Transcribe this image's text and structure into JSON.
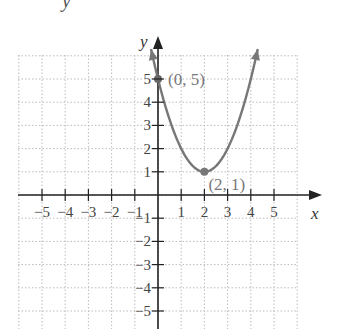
{
  "header": {
    "cropped_text": "y"
  },
  "chart_data": {
    "type": "line",
    "title": "",
    "xlabel": "x",
    "ylabel": "y",
    "xlim": [
      -6,
      6
    ],
    "ylim": [
      -6,
      6.5
    ],
    "grid": true,
    "grid_style": "dotted",
    "x_ticks": [
      -5,
      -4,
      -3,
      -2,
      -1,
      1,
      2,
      3,
      4,
      5
    ],
    "x_tick_labels": [
      "−5",
      "−4",
      "−3",
      "−2",
      "−1",
      "1",
      "2",
      "3",
      "4",
      "5"
    ],
    "y_ticks": [
      -5,
      -4,
      -3,
      -2,
      -1,
      1,
      2,
      3,
      4,
      5
    ],
    "y_tick_labels": [
      "−5",
      "−4",
      "−3",
      "−2",
      "−1",
      "1",
      "2",
      "3",
      "4",
      "5"
    ],
    "series": [
      {
        "name": "y = (x − 2)² + 1",
        "equation": "(x-2)^2+1",
        "x_range": [
          -0.3,
          4.3
        ],
        "color": "#777777",
        "arrows": "both"
      }
    ],
    "points": [
      {
        "x": 0,
        "y": 5,
        "label": "(0, 5)",
        "color": "#666666"
      },
      {
        "x": 2,
        "y": 1,
        "label": "(2, 1)",
        "color": "#777777"
      }
    ],
    "colors": {
      "axis": "#222222",
      "grid": "#bbbbbb",
      "curve": "#777777",
      "label": "#777777"
    }
  }
}
